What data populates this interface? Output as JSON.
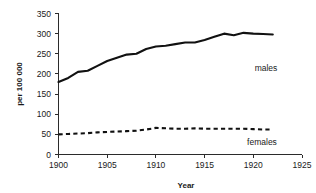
{
  "chart_data": {
    "type": "line",
    "title": "",
    "xlabel": "Year",
    "ylabel": "per 100 000",
    "xlim": [
      1900,
      1925
    ],
    "ylim": [
      0,
      350
    ],
    "xticks": [
      1900,
      1905,
      1910,
      1915,
      1920,
      1925
    ],
    "yticks": [
      0,
      50,
      100,
      150,
      200,
      250,
      300,
      350
    ],
    "grid": false,
    "legend_position": "inline-right",
    "x": [
      1900,
      1901,
      1902,
      1903,
      1904,
      1905,
      1906,
      1907,
      1908,
      1909,
      1910,
      1911,
      1912,
      1913,
      1914,
      1915,
      1916,
      1917,
      1918,
      1919,
      1920,
      1921,
      1922
    ],
    "series": [
      {
        "name": "males",
        "label": "males",
        "style": "solid",
        "values": [
          180,
          190,
          205,
          208,
          220,
          232,
          240,
          248,
          250,
          262,
          268,
          270,
          274,
          278,
          278,
          284,
          292,
          300,
          296,
          302,
          300,
          299,
          298
        ]
      },
      {
        "name": "females",
        "label": "females",
        "style": "dashed",
        "values": [
          50,
          51,
          52,
          53,
          55,
          56,
          57,
          58,
          59,
          62,
          66,
          65,
          64,
          64,
          65,
          64,
          64,
          64,
          64,
          64,
          63,
          62,
          62
        ]
      }
    ],
    "annotations": [
      {
        "name": "males-label",
        "text": "males",
        "x": 1922.5,
        "y": 265
      },
      {
        "name": "females-label",
        "text": "females",
        "x": 1921.5,
        "y": 28
      }
    ],
    "colors": {
      "line": "#111111",
      "axis": "#2b2b2b",
      "background": "#ffffff"
    }
  }
}
